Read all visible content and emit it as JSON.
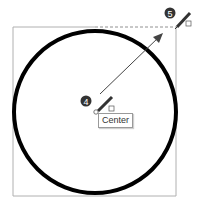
{
  "diagram": {
    "circle": {
      "cx": 95,
      "cy": 112,
      "r": 81,
      "stroke": "#000000"
    },
    "bounding_box": {
      "x": 13,
      "y": 27,
      "width": 163,
      "height": 169
    },
    "steps": [
      {
        "number": "4",
        "x": 86,
        "y": 101
      },
      {
        "number": "5",
        "x": 170,
        "y": 13
      }
    ],
    "tooltip": {
      "label": "Center"
    }
  }
}
